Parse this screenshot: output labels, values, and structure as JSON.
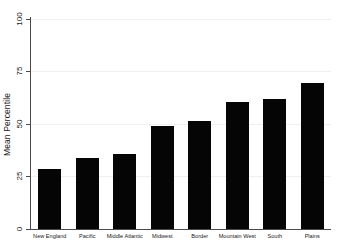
{
  "chart_data": {
    "type": "bar",
    "title": "",
    "xlabel": "",
    "ylabel": "Mean Percentile",
    "categories": [
      "New England",
      "Pacific",
      "Middle Atlantic",
      "Midwest",
      "Border",
      "Mountain West",
      "South",
      "Plains"
    ],
    "values": [
      28.5,
      33.5,
      35.5,
      48.8,
      51.0,
      60.2,
      61.8,
      69.5
    ],
    "ylim": [
      0,
      100
    ],
    "yticks": [
      0,
      25,
      50,
      75,
      100
    ],
    "ytick_labels": [
      "0",
      "25",
      "50",
      "75",
      "100"
    ],
    "grid": true,
    "grid_axis": "y",
    "legend": false,
    "bar_color": "#050505",
    "axis_color": "#4a4a4a",
    "grid_color": "#f0f0f0",
    "background": "#ffffff"
  }
}
